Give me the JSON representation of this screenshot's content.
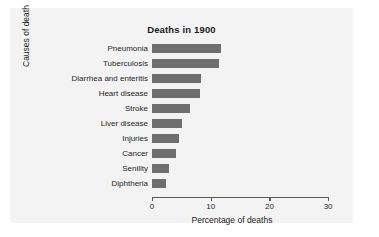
{
  "figure": {
    "background_color": "#ffffff",
    "panel_color": "#f3f3f3",
    "bar_color": "#6e6e6e",
    "axis_color": "#5a5a5a"
  },
  "chart_data": {
    "type": "bar",
    "orientation": "horizontal",
    "title": "Deaths in 1900",
    "xlabel": "Percentage of deaths",
    "ylabel": "Causes of death",
    "categories": [
      "Pneumonia",
      "Tuberculosis",
      "Diarrhea and enteritis",
      "Heart disease",
      "Stroke",
      "Liver disease",
      "Injuries",
      "Cancer",
      "Senility",
      "Diphtheria"
    ],
    "values": [
      11.7,
      11.4,
      8.3,
      8.1,
      6.4,
      5.1,
      4.6,
      4.1,
      2.9,
      2.3
    ],
    "xlim": [
      0,
      30
    ],
    "xticks": [
      0,
      10,
      20,
      30
    ],
    "xtick_labels": [
      "0",
      "10",
      "20",
      "30"
    ],
    "grid": false,
    "legend": null
  }
}
